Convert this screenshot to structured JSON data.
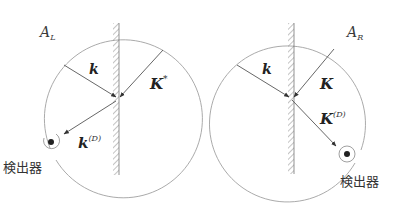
{
  "figure": {
    "panels": [
      {
        "id": "left",
        "region_label": {
          "main": "A",
          "sub": "L"
        },
        "vectors": {
          "incident": {
            "name": "k",
            "sup": ""
          },
          "other": {
            "name": "K",
            "sup": "*"
          },
          "detected": {
            "name": "k",
            "sup": "(D)"
          }
        },
        "detector_label": "検出器"
      },
      {
        "id": "right",
        "region_label": {
          "main": "A",
          "sub": "R"
        },
        "vectors": {
          "incident": {
            "name": "k",
            "sup": ""
          },
          "other": {
            "name": "K",
            "sup": ""
          },
          "detected": {
            "name": "K",
            "sup": "(D)"
          }
        },
        "detector_label": "検出器"
      }
    ],
    "colors": {
      "stroke": "#555555",
      "circle": "#9a9a9a",
      "hatch": "#888888",
      "text": "#222222",
      "background": "#ffffff"
    }
  }
}
